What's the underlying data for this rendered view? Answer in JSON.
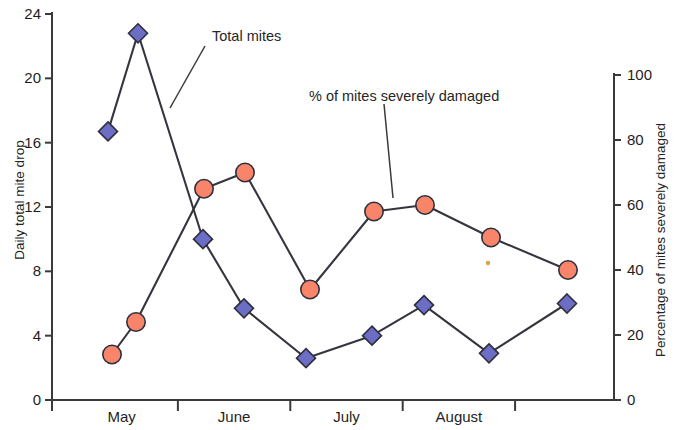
{
  "chart_data": {
    "type": "line",
    "title": "",
    "subtitle": "",
    "xlabel": "",
    "ylabel": "Daily total mite drop",
    "y2label": "Percentage of mites severely damaged",
    "ylim": [
      0,
      24
    ],
    "y2lim": [
      0,
      100
    ],
    "yticks": [
      "0",
      "4",
      "8",
      "12",
      "16",
      "20",
      "24"
    ],
    "ytick_values": [
      0,
      4,
      8,
      12,
      16,
      20,
      24
    ],
    "y2ticks": [
      "0",
      "20",
      "40",
      "60",
      "80",
      "100"
    ],
    "y2tick_values": [
      0,
      20,
      40,
      60,
      80,
      100
    ],
    "categories": [
      "May",
      "June",
      "July",
      "August"
    ],
    "grid": false,
    "legend_position": "inline-annotations",
    "series": [
      {
        "name": "Total mites",
        "axis": "left",
        "marker": "diamond",
        "color": "#6b6ec4",
        "x": [
          108,
          138,
          203,
          244,
          306,
          372,
          424,
          489,
          567
        ],
        "values": [
          16.7,
          22.8,
          10.0,
          5.7,
          2.6,
          4.0,
          5.9,
          2.9,
          6.0
        ]
      },
      {
        "name": "% of mites severely damaged",
        "axis": "right",
        "marker": "circle",
        "color": "#f8846a",
        "x": [
          112,
          136,
          204,
          245,
          310,
          374,
          425,
          491,
          568
        ],
        "values": [
          14,
          24,
          65,
          70,
          34,
          58,
          60,
          50,
          40
        ]
      }
    ],
    "annotations": [
      {
        "text": "Total mites",
        "x": 212,
        "y": 36
      },
      {
        "text": "% of mites severely damaged",
        "x": 309,
        "y": 97
      }
    ]
  },
  "axes": {
    "left_title": "Daily total mite drop",
    "right_title": "Percentage of mites severely damaged"
  },
  "annotations": {
    "total_mites": "Total mites",
    "pct_damaged": "% of mites severely damaged"
  }
}
